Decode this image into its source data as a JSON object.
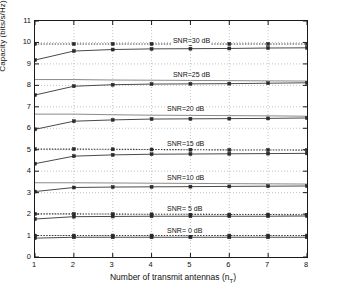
{
  "chart_data": {
    "type": "line",
    "title": "",
    "xlabel": "Number of transmit antennas (n_T)",
    "xlabel_main": "Number of transmit antennas (n",
    "xlabel_sub": "T",
    "xlabel_tail": ")",
    "ylabel": "Capacity (bits/s/Hz)",
    "xlim": [
      1,
      8
    ],
    "ylim": [
      0,
      11
    ],
    "xticks": [
      "1",
      "2",
      "3",
      "4",
      "5",
      "6",
      "7",
      "8"
    ],
    "yticks": [
      "0",
      "1",
      "2",
      "3",
      "4",
      "5",
      "6",
      "7",
      "8",
      "9",
      "10",
      "11"
    ],
    "grid": true,
    "grid_style": "dotted",
    "legend": "inline-annotations",
    "x": [
      1,
      2,
      3,
      4,
      5,
      6,
      7,
      8
    ],
    "series": [
      {
        "name": "SNR=30 dB bound",
        "style": "dotted",
        "color": "#3a3a3a",
        "values": [
          9.93,
          9.93,
          9.93,
          9.93,
          9.93,
          9.93,
          9.93,
          9.93
        ]
      },
      {
        "name": "SNR=30 dB capacity",
        "style": "solid-markers",
        "color": "#4a4a4a",
        "values": [
          9.18,
          9.6,
          9.67,
          9.7,
          9.71,
          9.72,
          9.74,
          9.75
        ]
      },
      {
        "name": "SNR=25 dB bound",
        "style": "solid-flat",
        "color": "#8a8a8a",
        "values": [
          8.27,
          8.27,
          8.25,
          8.24,
          8.23,
          8.22,
          8.21,
          8.2
        ]
      },
      {
        "name": "SNR=25 dB capacity",
        "style": "solid-markers",
        "color": "#4a4a4a",
        "values": [
          7.55,
          7.96,
          8.03,
          8.06,
          8.07,
          8.08,
          8.1,
          8.12
        ]
      },
      {
        "name": "SNR=20 dB bound",
        "style": "solid-flat",
        "color": "#8a8a8a",
        "values": [
          6.66,
          6.66,
          6.63,
          6.61,
          6.6,
          6.59,
          6.58,
          6.56
        ]
      },
      {
        "name": "SNR=20 dB capacity",
        "style": "solid-markers",
        "color": "#4a4a4a",
        "values": [
          5.95,
          6.33,
          6.39,
          6.43,
          6.44,
          6.45,
          6.46,
          6.48
        ]
      },
      {
        "name": "SNR=15 dB bound",
        "style": "dotted",
        "color": "#3a3a3a",
        "values": [
          5.03,
          5.03,
          5.02,
          5.01,
          5.0,
          4.99,
          4.99,
          4.98
        ]
      },
      {
        "name": "SNR=15 dB capacity",
        "style": "solid-markers",
        "color": "#4a4a4a",
        "values": [
          4.35,
          4.7,
          4.76,
          4.79,
          4.8,
          4.81,
          4.82,
          4.83
        ]
      },
      {
        "name": "SNR=10 dB bound",
        "style": "solid-flat",
        "color": "#8a8a8a",
        "values": [
          3.46,
          3.46,
          3.45,
          3.44,
          3.43,
          3.42,
          3.41,
          3.4
        ]
      },
      {
        "name": "SNR=10 dB capacity",
        "style": "solid-markers",
        "color": "#4a4a4a",
        "values": [
          3.05,
          3.24,
          3.26,
          3.27,
          3.28,
          3.29,
          3.3,
          3.31
        ]
      },
      {
        "name": "SNR= 5 dB bound",
        "style": "dotted",
        "color": "#3a3a3a",
        "values": [
          2.01,
          2.01,
          2.0,
          1.99,
          1.99,
          1.98,
          1.98,
          1.97
        ]
      },
      {
        "name": "SNR= 5 dB capacity",
        "style": "solid-markers",
        "color": "#4a4a4a",
        "values": [
          1.77,
          1.88,
          1.89,
          1.9,
          1.9,
          1.9,
          1.9,
          1.91
        ]
      },
      {
        "name": "SNR= 0 dB bound",
        "style": "dotted",
        "color": "#3a3a3a",
        "values": [
          1.0,
          1.0,
          1.0,
          1.0,
          1.0,
          1.0,
          1.0,
          1.0
        ]
      },
      {
        "name": "SNR= 0 dB capacity",
        "style": "solid-markers",
        "color": "#4a4a4a",
        "values": [
          0.88,
          0.92,
          0.92,
          0.92,
          0.92,
          0.92,
          0.92,
          0.92
        ]
      }
    ],
    "annotations": [
      {
        "text": "SNR=30 dB",
        "x": 4.55,
        "y": 10.0
      },
      {
        "text": "SNR=25 dB",
        "x": 4.55,
        "y": 8.45
      },
      {
        "text": "SNR=20 dB",
        "x": 4.4,
        "y": 6.85
      },
      {
        "text": "SNR=15 dB",
        "x": 4.4,
        "y": 5.2
      },
      {
        "text": "SNR=10 dB",
        "x": 4.4,
        "y": 3.62
      },
      {
        "text": "SNR= 5 dB",
        "x": 4.4,
        "y": 2.17
      },
      {
        "text": "SNR= 0 dB",
        "x": 4.4,
        "y": 1.18
      }
    ]
  }
}
